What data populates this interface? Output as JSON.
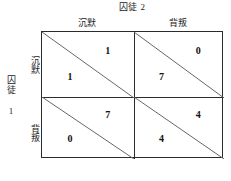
{
  "diagram": {
    "type": "payoff-matrix",
    "column_player_title": "囚徒 2",
    "row_player_title": "囚徒 1",
    "column_headers": [
      "沉默",
      "背叛"
    ],
    "row_headers": [
      "沉默",
      "背叛"
    ],
    "cells": [
      {
        "row": "沉默",
        "col": "沉默",
        "row_payoff": "1",
        "col_payoff": "1"
      },
      {
        "row": "沉默",
        "col": "背叛",
        "row_payoff": "7",
        "col_payoff": "0"
      },
      {
        "row": "背叛",
        "col": "沉默",
        "row_payoff": "0",
        "col_payoff": "7"
      },
      {
        "row": "背叛",
        "col": "背叛",
        "row_payoff": "4",
        "col_payoff": "4"
      }
    ],
    "colors": {
      "border": "#2b2b2b",
      "diagonal": "#666666",
      "text": "#111111",
      "background": "#ffffff"
    }
  }
}
